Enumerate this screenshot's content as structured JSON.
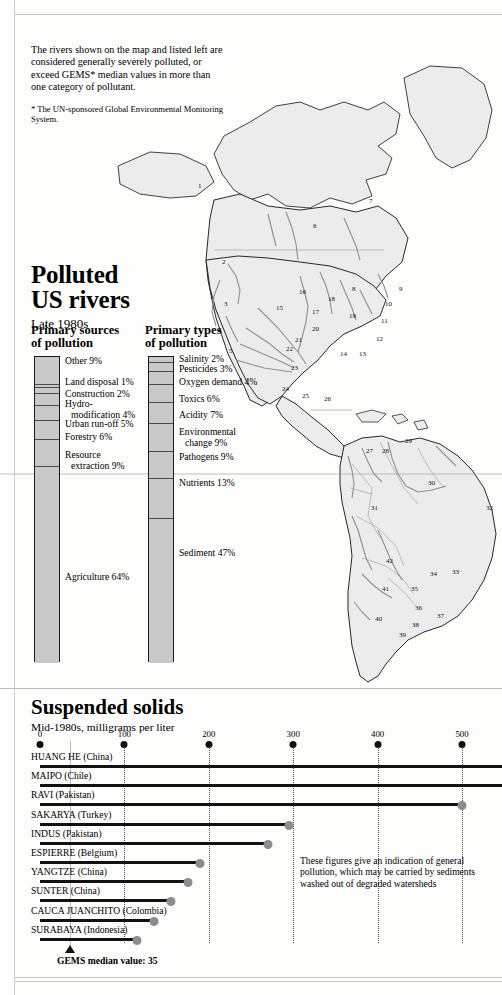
{
  "intro": {
    "body": "The rivers shown on the map and listed left are considered generally severely polluted, or exceed GEMS* median values in more than one category of pollutant.",
    "footnote": "* The UN-sponsored Global Environmental Monitoring System."
  },
  "title": {
    "line1": "Polluted",
    "line2": "US rivers",
    "subtitle": "Late 1980s"
  },
  "sources_chart": {
    "heading_line1": "Primary sources",
    "heading_line2": "of pollution",
    "segments": [
      {
        "label": "Other 9%",
        "value": 9,
        "indent": false
      },
      {
        "label": "Land disposal 1%",
        "value": 1,
        "indent": false
      },
      {
        "label": "Construction 2%",
        "value": 2,
        "indent": false
      },
      {
        "label": "Hydro-",
        "label2": "modification 4%",
        "value": 4,
        "indent": true
      },
      {
        "label": "Urban run-off 5%",
        "value": 5,
        "indent": false
      },
      {
        "label": "Forestry 6%",
        "value": 6,
        "indent": false
      },
      {
        "label": "Resource",
        "label2": "extraction 9%",
        "value": 9,
        "indent": false
      },
      {
        "label": "Agriculture 64%",
        "value": 64,
        "indent": false
      }
    ]
  },
  "types_chart": {
    "heading_line1": "Primary types",
    "heading_line2": "of pollution",
    "segments": [
      {
        "label": "Salinity 2%",
        "value": 2
      },
      {
        "label": "Pesticides 3%",
        "value": 3
      },
      {
        "label": "Oxygen demand 4%",
        "value": 4
      },
      {
        "label": "Toxics 6%",
        "value": 6
      },
      {
        "label": "Acidity 7%",
        "value": 7
      },
      {
        "label": "Environmental",
        "label2": "change 9%",
        "value": 9
      },
      {
        "label": "Pathogens 9%",
        "value": 9
      },
      {
        "label": "Nutrients 13%",
        "value": 13
      },
      {
        "label": "Sediment 47%",
        "value": 47
      }
    ]
  },
  "suspended": {
    "title": "Suspended solids",
    "subtitle": "Mid-1980s, milligrams per liter",
    "note": "These figures give an indication of general pollution, which may be carried by sediments washed out of degraded watersheds",
    "median_label": "GEMS median value: 35",
    "median_value": 35
  },
  "chart_data": [
    {
      "type": "bar",
      "orientation": "vertical-stacked",
      "title": "Primary sources of pollution",
      "subtitle": "Polluted US rivers, Late 1980s",
      "xlabel": "",
      "ylabel": "Share of pollution sources (%)",
      "ylim": [
        0,
        100
      ],
      "categories": [
        "Other",
        "Land disposal",
        "Construction",
        "Hydro-modification",
        "Urban run-off",
        "Forestry",
        "Resource extraction",
        "Agriculture"
      ],
      "values": [
        9,
        1,
        2,
        4,
        5,
        6,
        9,
        64
      ],
      "unit": "%",
      "grid": false,
      "legend": "none"
    },
    {
      "type": "bar",
      "orientation": "vertical-stacked",
      "title": "Primary types of pollution",
      "subtitle": "Polluted US rivers, Late 1980s",
      "xlabel": "",
      "ylabel": "Share of pollution types (%)",
      "ylim": [
        0,
        100
      ],
      "categories": [
        "Salinity",
        "Pesticides",
        "Oxygen demand",
        "Toxics",
        "Acidity",
        "Environmental change",
        "Pathogens",
        "Nutrients",
        "Sediment"
      ],
      "values": [
        2,
        3,
        4,
        6,
        7,
        9,
        9,
        13,
        47
      ],
      "unit": "%",
      "grid": false,
      "legend": "none"
    },
    {
      "type": "bar",
      "orientation": "horizontal",
      "title": "Suspended solids",
      "subtitle": "Mid-1980s, milligrams per liter",
      "xlabel": "milligrams per liter",
      "ylabel": "",
      "xlim": [
        0,
        550
      ],
      "ticks": [
        0,
        100,
        200,
        300,
        400,
        500
      ],
      "grid": true,
      "legend": "none",
      "reference_line": {
        "label": "GEMS median value: 35",
        "value": 35
      },
      "categories": [
        "HUANG HE (China)",
        "MAIPO (Chile)",
        "RAVI (Pakistan)",
        "SAKARYA (Turkey)",
        "INDUS (Pakistan)",
        "ESPIERRE (Belgium)",
        "YANGTZE (China)",
        "SUNTER (China)",
        "CAUCA JUANCHITO (Colombia)",
        "SURABAYA (Indonesia)"
      ],
      "values": [
        560,
        550,
        500,
        295,
        270,
        190,
        175,
        155,
        135,
        115
      ],
      "offscale": [
        true,
        true,
        false,
        false,
        false,
        false,
        false,
        false,
        false,
        false
      ],
      "rivers": [
        {
          "name": "HUANG HE",
          "country": "China",
          "value": 560,
          "offscale": true
        },
        {
          "name": "MAIPO",
          "country": "Chile",
          "value": 550,
          "offscale": true
        },
        {
          "name": "RAVI",
          "country": "Pakistan",
          "value": 500,
          "offscale": false
        },
        {
          "name": "SAKARYA",
          "country": "Turkey",
          "value": 295,
          "offscale": false
        },
        {
          "name": "INDUS",
          "country": "Pakistan",
          "value": 270,
          "offscale": false
        },
        {
          "name": "ESPIERRE",
          "country": "Belgium",
          "value": 190,
          "offscale": false
        },
        {
          "name": "YANGTZE",
          "country": "China",
          "value": 175,
          "offscale": false
        },
        {
          "name": "SUNTER",
          "country": "China",
          "value": 155,
          "offscale": false
        },
        {
          "name": "CAUCA JUANCHITO",
          "country": "Colombia",
          "value": 135,
          "offscale": false
        },
        {
          "name": "SURABAYA",
          "country": "Indonesia",
          "value": 115,
          "offscale": false
        }
      ]
    }
  ],
  "map": {
    "markers": [
      "1",
      "2",
      "3",
      "4",
      "5",
      "6",
      "7",
      "8",
      "9",
      "10",
      "11",
      "12",
      "13",
      "14",
      "15",
      "16",
      "17",
      "18",
      "19",
      "20",
      "21",
      "22",
      "23",
      "24",
      "25",
      "26",
      "27",
      "28",
      "29",
      "30",
      "31",
      "32",
      "33",
      "34",
      "35",
      "36",
      "37",
      "38",
      "39",
      "40",
      "41",
      "42"
    ]
  },
  "colors": {
    "bar_fill": "#c9c9c9",
    "bar_stroke": "#1a1a1a",
    "dot": "#8c8c8c",
    "rule": "#c8c8c8",
    "land": "#ececec",
    "river": "#8f8f8f"
  }
}
